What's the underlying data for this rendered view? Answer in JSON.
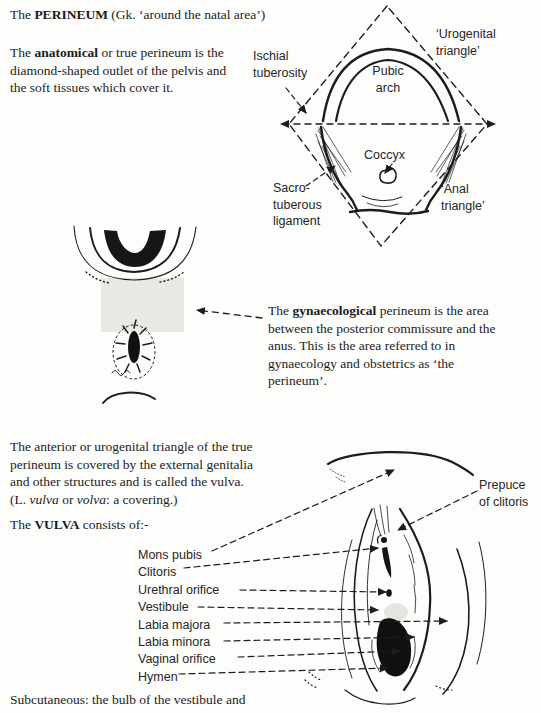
{
  "colors": {
    "ink": "#1c1c1c",
    "paper": "#ffffff",
    "shade_area": "#e9e9e4"
  },
  "header": {
    "title_prefix": "The ",
    "title_keyword": "PERINEUM",
    "title_suffix": " (Gk. ‘around the natal area’)"
  },
  "paragraphs": {
    "anatomical": {
      "prefix": "The ",
      "bold": "anatomical",
      "suffix": " or true perineum is the diamond-shaped outlet of the pelvis and the soft tissues which cover it."
    },
    "gynaecological": {
      "prefix": "The ",
      "bold": "gynaecological",
      "suffix": " perineum is the area between the posterior commissure and the anus. This is the area referred to in gynaecology and obstetrics as ‘the perineum’."
    },
    "urogenital": {
      "lead": "The anterior or urogenital triangle of the true perineum is covered by the external genitalia and other structures and is called the vulva. (L. ",
      "italic1": "vulva",
      "mid": " or ",
      "italic2": "volva",
      "tail": ": a covering.)"
    },
    "vulva_intro": {
      "prefix": "The ",
      "bold": "VULVA",
      "suffix": " consists of:-"
    },
    "footer": "Subcutaneous: the bulb of the vestibule and"
  },
  "diamond_diagram": {
    "labels": {
      "ischial_tuberosity": "Ischial\ntuberosity",
      "pubic_arch": "Pubic\narch",
      "urogenital_triangle": "‘Urogenital\ntriangle’",
      "coccyx": "Coccyx",
      "sacrotuberous_ligament": "Sacro-\ntuberous\nligament",
      "anal_triangle": "‘Anal\ntriangle’"
    }
  },
  "vulva_figure": {
    "labels": [
      "Mons pubis",
      "Clitoris",
      "Urethral orifice",
      "Vestibule",
      "Labia majora",
      "Labia minora",
      "Vaginal orifice",
      "Hymen"
    ],
    "prepuce_label": "Prepuce\nof clitoris"
  }
}
